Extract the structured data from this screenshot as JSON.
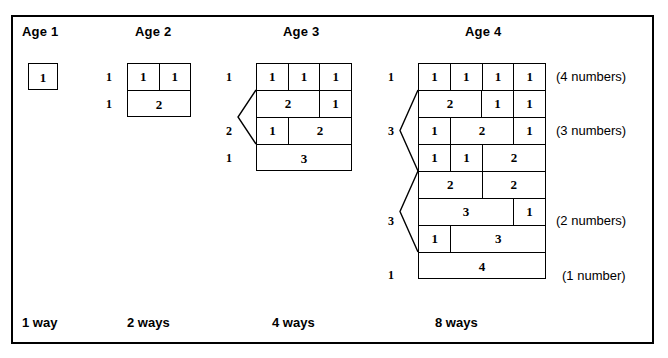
{
  "figure": {
    "headers": [
      {
        "label": "Age 1",
        "x": 22,
        "y": 24
      },
      {
        "label": "Age 2",
        "x": 135,
        "y": 24
      },
      {
        "label": "Age 3",
        "x": 283,
        "y": 24
      },
      {
        "label": "Age 4",
        "x": 465,
        "y": 24
      }
    ],
    "footers": [
      {
        "label": "1 way",
        "x": 22,
        "y": 315
      },
      {
        "label": "2 ways",
        "x": 127,
        "y": 315
      },
      {
        "label": "4 ways",
        "x": 272,
        "y": 315
      },
      {
        "label": "8 ways",
        "x": 435,
        "y": 315
      }
    ],
    "side_labels": [
      {
        "label": "(4 numbers)",
        "x": 556,
        "y": 69
      },
      {
        "label": "(3 numbers)",
        "x": 556,
        "y": 123
      },
      {
        "label": "(2 numbers)",
        "x": 556,
        "y": 213
      },
      {
        "label": "(1 number)",
        "x": 562,
        "y": 268
      }
    ],
    "groups": [
      {
        "name": "age-1",
        "grid": {
          "left": 28,
          "top": 63,
          "width": 30
        },
        "rows": [
          {
            "cells": [
              {
                "text": "1",
                "span": 1
              }
            ]
          }
        ],
        "row_counts": [],
        "brackets": []
      },
      {
        "name": "age-2",
        "grid": {
          "left": 127,
          "top": 63,
          "width": 64
        },
        "rows": [
          {
            "cells": [
              {
                "text": "1",
                "span": 1
              },
              {
                "text": "1",
                "span": 1
              }
            ]
          },
          {
            "cells": [
              {
                "text": "2",
                "span": 2
              }
            ]
          }
        ],
        "row_counts": [
          {
            "text": "1",
            "x": 106,
            "y": 70
          },
          {
            "text": "1",
            "x": 106,
            "y": 97
          }
        ],
        "brackets": []
      },
      {
        "name": "age-3",
        "grid": {
          "left": 256,
          "top": 63,
          "width": 96
        },
        "rows": [
          {
            "cells": [
              {
                "text": "1",
                "span": 1
              },
              {
                "text": "1",
                "span": 1
              },
              {
                "text": "1",
                "span": 1
              }
            ]
          },
          {
            "cells": [
              {
                "text": "2",
                "span": 2
              },
              {
                "text": "1",
                "span": 1
              }
            ]
          },
          {
            "cells": [
              {
                "text": "1",
                "span": 1
              },
              {
                "text": "2",
                "span": 2
              }
            ]
          },
          {
            "cells": [
              {
                "text": "3",
                "span": 3
              }
            ]
          }
        ],
        "row_counts": [
          {
            "text": "1",
            "x": 226,
            "y": 70
          },
          {
            "text": "2",
            "x": 226,
            "y": 124
          },
          {
            "text": "1",
            "x": 226,
            "y": 151
          }
        ],
        "brackets": [
          {
            "x": 238,
            "top": 90,
            "height": 54,
            "width": 18
          }
        ]
      },
      {
        "name": "age-4",
        "grid": {
          "left": 418,
          "top": 63,
          "width": 128
        },
        "rows": [
          {
            "cells": [
              {
                "text": "1",
                "span": 1
              },
              {
                "text": "1",
                "span": 1
              },
              {
                "text": "1",
                "span": 1
              },
              {
                "text": "1",
                "span": 1
              }
            ]
          },
          {
            "cells": [
              {
                "text": "2",
                "span": 2
              },
              {
                "text": "1",
                "span": 1
              },
              {
                "text": "1",
                "span": 1
              }
            ]
          },
          {
            "cells": [
              {
                "text": "1",
                "span": 1
              },
              {
                "text": "2",
                "span": 2
              },
              {
                "text": "1",
                "span": 1
              }
            ]
          },
          {
            "cells": [
              {
                "text": "1",
                "span": 1
              },
              {
                "text": "1",
                "span": 1
              },
              {
                "text": "2",
                "span": 2
              }
            ]
          },
          {
            "cells": [
              {
                "text": "2",
                "span": 2
              },
              {
                "text": "2",
                "span": 2
              }
            ]
          },
          {
            "cells": [
              {
                "text": "3",
                "span": 3
              },
              {
                "text": "1",
                "span": 1
              }
            ]
          },
          {
            "cells": [
              {
                "text": "1",
                "span": 1
              },
              {
                "text": "3",
                "span": 3
              }
            ]
          },
          {
            "cells": [
              {
                "text": "4",
                "span": 4
              }
            ]
          }
        ],
        "row_counts": [
          {
            "text": "1",
            "x": 388,
            "y": 70
          },
          {
            "text": "3",
            "x": 388,
            "y": 124
          },
          {
            "text": "3",
            "x": 388,
            "y": 214
          },
          {
            "text": "1",
            "x": 388,
            "y": 268
          }
        ],
        "brackets": [
          {
            "x": 400,
            "top": 90,
            "height": 81,
            "width": 18
          },
          {
            "x": 400,
            "top": 171,
            "height": 81,
            "width": 18
          }
        ]
      }
    ]
  }
}
